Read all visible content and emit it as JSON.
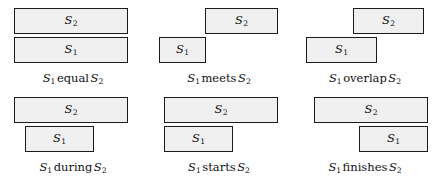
{
  "figure": {
    "background_color": "#ffffff",
    "bar_fill_color": "#f0f0f0",
    "bar_border_color": "#1a1a1a",
    "text_color": "#111111"
  },
  "labels": {
    "s1": "S",
    "s1_sub": "1",
    "s2": "S",
    "s2_sub": "2"
  },
  "panels": [
    {
      "id": "equal",
      "relation": "equal",
      "caption_text": "S1 equal S2",
      "s2_bar": {
        "label": "S",
        "sub": "2",
        "left": 14,
        "top": 8,
        "width": 114
      },
      "s1_bar": {
        "label": "S",
        "sub": "1",
        "left": 14,
        "top": 37,
        "width": 114
      }
    },
    {
      "id": "meets",
      "relation": "meets",
      "caption_text": "S1 meets S2",
      "s2_bar": {
        "label": "S",
        "sub": "2",
        "left": 59,
        "top": 8,
        "width": 73
      },
      "s1_bar": {
        "label": "S",
        "sub": "1",
        "left": 13,
        "top": 37,
        "width": 47
      }
    },
    {
      "id": "overlap",
      "relation": "overlap",
      "caption_text": "S1 overlap S2",
      "s2_bar": {
        "label": "S",
        "sub": "2",
        "left": 61,
        "top": 8,
        "width": 71
      },
      "s1_bar": {
        "label": "S",
        "sub": "1",
        "left": 14,
        "top": 37,
        "width": 71
      }
    },
    {
      "id": "during",
      "relation": "during",
      "caption_text": "S1 during S2",
      "s2_bar": {
        "label": "S",
        "sub": "2",
        "left": 14,
        "top": 8,
        "width": 114
      },
      "s1_bar": {
        "label": "S",
        "sub": "1",
        "left": 25,
        "top": 37,
        "width": 69
      }
    },
    {
      "id": "starts",
      "relation": "starts",
      "caption_text": "S1 starts S2",
      "s2_bar": {
        "label": "S",
        "sub": "2",
        "left": 18,
        "top": 8,
        "width": 114
      },
      "s1_bar": {
        "label": "S",
        "sub": "1",
        "left": 18,
        "top": 37,
        "width": 69
      }
    },
    {
      "id": "finishes",
      "relation": "finishes",
      "caption_text": "S1 finishes S2",
      "s2_bar": {
        "label": "S",
        "sub": "2",
        "left": 22,
        "top": 8,
        "width": 114
      },
      "s1_bar": {
        "label": "S",
        "sub": "1",
        "left": 67,
        "top": 37,
        "width": 69
      }
    }
  ]
}
